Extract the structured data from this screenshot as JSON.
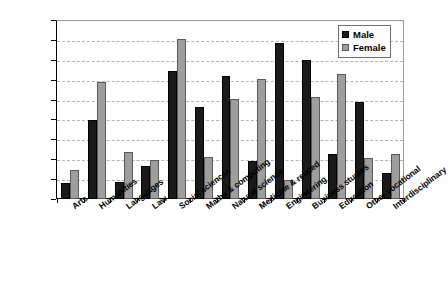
{
  "chart_data": {
    "type": "bar",
    "title": "",
    "xlabel": "",
    "ylabel": "% in each category",
    "ylim": [
      0,
      18
    ],
    "ytick_step": 2,
    "yticks": [
      "18",
      "16",
      "14",
      "12",
      "10",
      "8",
      "6",
      "4",
      "2",
      "0"
    ],
    "grid": true,
    "legend_position": "top-right",
    "categories": [
      "Arts",
      "Humanities",
      "Languages",
      "Law",
      "Social sciences",
      "Maths & computing",
      "Natural science",
      "Medicine & related",
      "Engineering",
      "Business studies",
      "Education",
      "Other vocational",
      "Interdisciplinary"
    ],
    "series": [
      {
        "name": "Male",
        "color": "#1a1a1a",
        "values": [
          1.6,
          7.9,
          1.7,
          3.3,
          12.9,
          9.3,
          12.4,
          3.8,
          15.7,
          14.0,
          4.5,
          9.8,
          2.6
        ]
      },
      {
        "name": "Female",
        "color": "#9e9e9e",
        "values": [
          2.9,
          11.8,
          4.7,
          3.9,
          16.1,
          4.2,
          10.1,
          12.1,
          1.9,
          10.3,
          12.6,
          4.1,
          4.5
        ]
      }
    ]
  }
}
